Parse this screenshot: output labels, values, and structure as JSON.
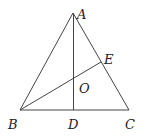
{
  "diagram": {
    "type": "geometry-triangle",
    "points": {
      "A": {
        "label": "A",
        "x": 73,
        "y": 13
      },
      "B": {
        "label": "B",
        "x": 20,
        "y": 110
      },
      "C": {
        "label": "C",
        "x": 129,
        "y": 110
      },
      "D": {
        "label": "D",
        "x": 74,
        "y": 110
      },
      "E": {
        "label": "E",
        "x": 101,
        "y": 62
      },
      "O": {
        "label": "O",
        "x": 74,
        "y": 78
      }
    },
    "segments": [
      "AB",
      "AC",
      "BC",
      "AD",
      "BE"
    ],
    "labels": {
      "A": "A",
      "B": "B",
      "C": "C",
      "D": "D",
      "E": "E",
      "O": "O"
    }
  }
}
